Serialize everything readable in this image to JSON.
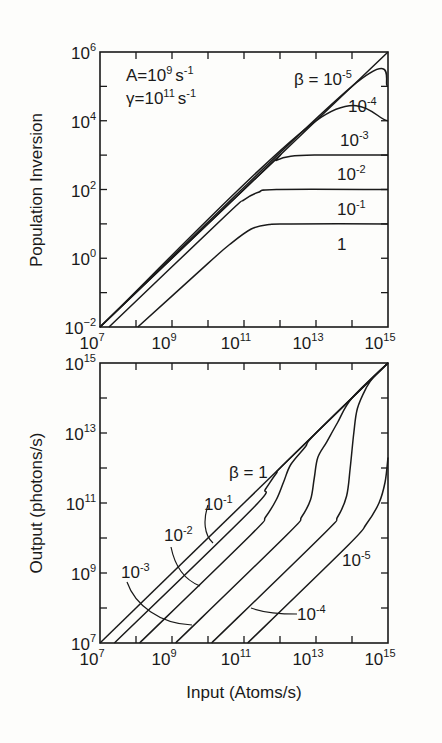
{
  "chart_data": [
    {
      "id": "top",
      "type": "line",
      "xscale": "log",
      "yscale": "log",
      "xlabel": "",
      "ylabel": "Population Inversion",
      "xlim_log10": [
        7,
        15
      ],
      "ylim_log10": [
        -2,
        6
      ],
      "x_tick_exponents": [
        7,
        9,
        11,
        13,
        15
      ],
      "y_tick_exponents": [
        -2,
        0,
        2,
        4,
        6
      ],
      "tick_base": "10",
      "annotations": [
        {
          "base": "A=10",
          "exp": "9",
          "unit": "s",
          "unit_exp": "-1"
        },
        {
          "base": "γ=10",
          "exp": "11",
          "unit": "s",
          "unit_exp": "-1"
        }
      ],
      "series": [
        {
          "name": "β = 10^-5",
          "label_base": "β = 10",
          "label_exp": "-5",
          "points_log10": [
            [
              7,
              -2
            ],
            [
              15,
              6
            ]
          ]
        },
        {
          "name": "β = 10^-4",
          "label_base": "10",
          "label_exp": "-4",
          "points_log10": [
            [
              7,
              -2
            ],
            [
              14,
              5
            ],
            [
              15,
              5
            ]
          ]
        },
        {
          "name": "β = 10^-3",
          "label_base": "10",
          "label_exp": "-3",
          "points_log10": [
            [
              7,
              -2
            ],
            [
              13,
              4
            ],
            [
              15,
              4
            ]
          ]
        },
        {
          "name": "β = 10^-2",
          "label_base": "10",
          "label_exp": "-2",
          "points_log10": [
            [
              7,
              -2
            ],
            [
              11.6,
              2.6
            ],
            [
              11.9,
              2.85
            ],
            [
              12.3,
              2.97
            ],
            [
              13,
              3
            ],
            [
              15,
              3
            ]
          ]
        },
        {
          "name": "β = 10^-1",
          "label_base": "10",
          "label_exp": "-1",
          "points_log10": [
            [
              7.25,
              -2
            ],
            [
              10.5,
              1.25
            ],
            [
              11,
              1.7
            ],
            [
              11.4,
              1.92
            ],
            [
              11.9,
              2
            ],
            [
              15,
              2
            ]
          ]
        },
        {
          "name": "β = 1",
          "label_base": "1",
          "label_exp": "",
          "points_log10": [
            [
              8.05,
              -2
            ],
            [
              10,
              -0.15
            ],
            [
              10.6,
              0.4
            ],
            [
              11.2,
              0.85
            ],
            [
              11.7,
              0.98
            ],
            [
              12.3,
              1
            ],
            [
              15,
              1
            ]
          ]
        }
      ]
    },
    {
      "id": "bottom",
      "type": "line",
      "xscale": "log",
      "yscale": "log",
      "xlabel": "Input (Atoms/s)",
      "ylabel": "Output (photons/s)",
      "xlim_log10": [
        7,
        15
      ],
      "ylim_log10": [
        7,
        15
      ],
      "x_tick_exponents": [
        7,
        9,
        11,
        13,
        15
      ],
      "y_tick_exponents": [
        7,
        9,
        11,
        13,
        15
      ],
      "tick_base": "10",
      "series": [
        {
          "name": "β = 1",
          "label_base": "β = 1",
          "label_exp": "",
          "points_log10": [
            [
              7,
              7
            ],
            [
              15,
              15
            ]
          ]
        },
        {
          "name": "β = 10^-1",
          "label_base": "10",
          "label_exp": "-1",
          "points_log10": [
            [
              7.4,
              7
            ],
            [
              11.2,
              10.8
            ],
            [
              11.6,
              11.4
            ],
            [
              11.9,
              11.85
            ],
            [
              12.2,
              12.2
            ],
            [
              15,
              15
            ]
          ]
        },
        {
          "name": "β = 10^-2",
          "label_base": "10",
          "label_exp": "-2",
          "points_log10": [
            [
              8.1,
              7
            ],
            [
              11.2,
              10.1
            ],
            [
              11.6,
              10.6
            ],
            [
              11.9,
              11.1
            ],
            [
              12.1,
              11.6
            ],
            [
              12.3,
              12.1
            ],
            [
              12.7,
              12.6
            ],
            [
              13,
              13
            ],
            [
              15,
              15
            ]
          ]
        },
        {
          "name": "β = 10^-3",
          "label_base": "10",
          "label_exp": "-3",
          "points_log10": [
            [
              9.1,
              7
            ],
            [
              12.2,
              10.1
            ],
            [
              12.6,
              10.6
            ],
            [
              12.85,
              11.1
            ],
            [
              12.95,
              11.7
            ],
            [
              13.05,
              12.3
            ],
            [
              13.3,
              12.75
            ],
            [
              13.6,
              13.3
            ],
            [
              14,
              14
            ],
            [
              15,
              15
            ]
          ]
        },
        {
          "name": "β = 10^-4",
          "label_base": "10",
          "label_exp": "-4",
          "points_log10": [
            [
              10.1,
              7
            ],
            [
              13.2,
              10.1
            ],
            [
              13.6,
              10.6
            ],
            [
              13.85,
              11.2
            ],
            [
              13.95,
              12
            ],
            [
              14.05,
              13
            ],
            [
              14.15,
              13.7
            ],
            [
              14.4,
              14.3
            ],
            [
              14.6,
              14.6
            ],
            [
              15,
              15
            ]
          ]
        },
        {
          "name": "β = 10^-5",
          "label_base": "10",
          "label_exp": "-5",
          "points_log10": [
            [
              11.1,
              7
            ],
            [
              13.9,
              9.8
            ],
            [
              14.4,
              10.4
            ],
            [
              14.75,
              11
            ],
            [
              14.92,
              11.6
            ],
            [
              15,
              12.3
            ]
          ]
        }
      ]
    }
  ]
}
